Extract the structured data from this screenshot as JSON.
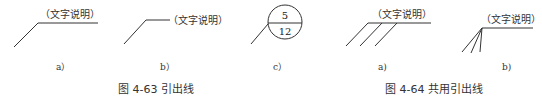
{
  "figure_4_63": {
    "caption": "图 4-63   引出线",
    "panels": [
      {
        "label": "a）",
        "annotation": "（文字说明）"
      },
      {
        "label": "b）",
        "annotation": "（文字说明）"
      },
      {
        "label": "c）",
        "circle_top": "5",
        "circle_bottom": "12"
      }
    ]
  },
  "figure_4_64": {
    "caption": "图 4-64   共用引出线",
    "panels": [
      {
        "label": "a)",
        "annotation": "（文字说明）"
      },
      {
        "label": "b)",
        "annotation": "（文字说明）"
      }
    ]
  },
  "colors": {
    "line": "#333333",
    "text": "#333333",
    "background": "#ffffff"
  }
}
